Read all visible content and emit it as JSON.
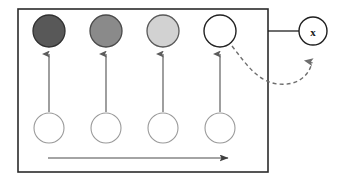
{
  "figure": {
    "type": "node-link-diagram",
    "background_color": "#ffffff",
    "container": {
      "name": "outer-box",
      "x": 18,
      "y": 9,
      "width": 250,
      "height": 163,
      "stroke": "#2b2b2b",
      "stroke_width": 1.6,
      "fill": "#ffffff"
    },
    "top_row": {
      "label": "top-row-nodes",
      "center_y": 31,
      "radius": 16,
      "nodes": [
        {
          "id": "top-1",
          "label": "",
          "cx": 49,
          "fill": "#585858",
          "stroke": "#303030",
          "shade": "dark-gray"
        },
        {
          "id": "top-2",
          "label": "",
          "cx": 106,
          "fill": "#8a8a8a",
          "stroke": "#4a4a4a",
          "shade": "medium-gray"
        },
        {
          "id": "top-3",
          "label": "",
          "cx": 163,
          "fill": "#d2d2d2",
          "stroke": "#595959",
          "shade": "light-gray"
        },
        {
          "id": "top-4",
          "label": "",
          "cx": 220,
          "fill": "#ffffff",
          "stroke": "#222222",
          "shade": "white"
        }
      ]
    },
    "bottom_row": {
      "label": "bottom-row-nodes",
      "center_y": 128,
      "radius": 15,
      "nodes": [
        {
          "id": "bottom-1",
          "label": "",
          "cx": 49,
          "fill": "#ffffff",
          "stroke": "#9a9a9a"
        },
        {
          "id": "bottom-2",
          "label": "",
          "cx": 106,
          "fill": "#ffffff",
          "stroke": "#9a9a9a"
        },
        {
          "id": "bottom-3",
          "label": "",
          "cx": 163,
          "fill": "#ffffff",
          "stroke": "#9a9a9a"
        },
        {
          "id": "bottom-4",
          "label": "",
          "cx": 220,
          "fill": "#ffffff",
          "stroke": "#9a9a9a"
        }
      ]
    },
    "external_node": {
      "id": "node-x",
      "label": "x",
      "cx": 313,
      "cy": 31,
      "radius": 14,
      "fill": "#ffffff",
      "stroke": "#1f1f1f",
      "stroke_width": 1.4
    },
    "vertical_arrows": {
      "label": "upward-arrows",
      "count": 4,
      "from_y": 112,
      "to_y": 52,
      "stroke": "#6b6b6b",
      "stroke_width": 1.3,
      "x_positions": [
        49,
        106,
        163,
        220
      ]
    },
    "bottom_arrow": {
      "label": "time-arrow",
      "x1": 48,
      "x2": 230,
      "y": 158,
      "stroke": "#4a4a4a",
      "stroke_width": 1.2,
      "direction": "right"
    },
    "connector_line": {
      "label": "box-to-x-connector",
      "x1": 268,
      "x2": 299,
      "y": 31,
      "stroke": "#1f1f1f",
      "stroke_width": 1.3
    },
    "dashed_arrow": {
      "label": "feedback-arrow",
      "path": "M 232 46 C 246 64, 258 82, 278 84 C 296 86, 308 76, 312 60",
      "stroke": "#6e6e6e",
      "stroke_width": 1.4,
      "dash_pattern": "4,3",
      "direction": "up",
      "arrowhead_at": {
        "x": 312,
        "y": 54
      }
    }
  }
}
